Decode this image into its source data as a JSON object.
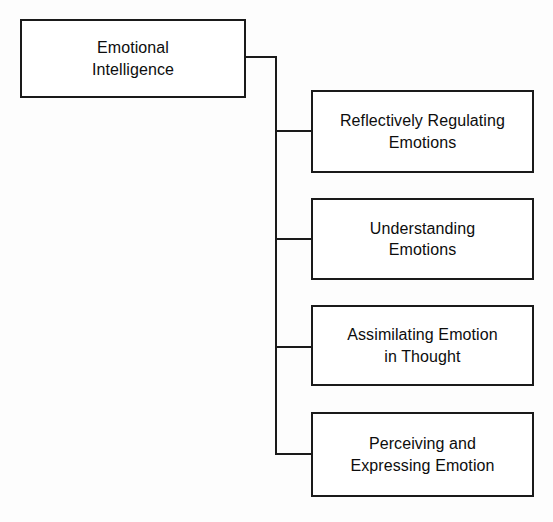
{
  "diagram": {
    "type": "hierarchy-tree",
    "orientation": "left-root-right-children",
    "background_color": "#fdfdfd",
    "line_color": "#1a1a1a",
    "box_fill_color": "#ffffff",
    "text_color": "#0d0d0d",
    "root": {
      "label": "Emotional\nIntelligence",
      "line_1": "Emotional",
      "line_2": "Intelligence"
    },
    "children": [
      {
        "label": "Reflectively Regulating\nEmotions",
        "line_1": "Reflectively Regulating",
        "line_2": "Emotions"
      },
      {
        "label": "Understanding\nEmotions",
        "line_1": "Understanding",
        "line_2": "Emotions"
      },
      {
        "label": "Assimilating Emotion\nin Thought",
        "line_1": "Assimilating Emotion",
        "line_2": "in Thought"
      },
      {
        "label": "Perceiving and\nExpressing Emotion",
        "line_1": "Perceiving and",
        "line_2": "Expressing Emotion"
      }
    ]
  }
}
